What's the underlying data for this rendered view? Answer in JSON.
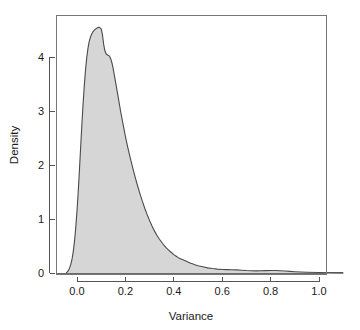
{
  "figure": {
    "background_color": "#ffffff",
    "panel_border_color": "#777777",
    "fill_color": "#d6d6d6",
    "line_color": "#4a4a4a",
    "text_color": "#1a1a1a"
  },
  "chart_data": {
    "type": "area",
    "title": "",
    "subtitle": "",
    "xlabel": "Variance",
    "ylabel": "Density",
    "xlim": [
      -0.06,
      1.12
    ],
    "ylim": [
      -0.08,
      4.75
    ],
    "xticks": [
      0.0,
      0.2,
      0.4,
      0.6,
      0.8,
      1.0
    ],
    "xticklabels": [
      "0.0",
      "0.2",
      "0.4",
      "0.6",
      "0.8",
      "1.0"
    ],
    "yticks": [
      0,
      1,
      2,
      3,
      4
    ],
    "yticklabels": [
      "0",
      "1",
      "2",
      "3",
      "4"
    ],
    "grid": false,
    "legend": null,
    "annotations": [],
    "series": [
      {
        "name": "Variance density",
        "fill": "#d6d6d6",
        "stroke": "#4a4a4a",
        "x": [
          -0.045,
          -0.04,
          -0.035,
          -0.03,
          -0.025,
          -0.02,
          -0.015,
          -0.01,
          -0.005,
          0.0,
          0.005,
          0.01,
          0.015,
          0.02,
          0.025,
          0.03,
          0.035,
          0.04,
          0.045,
          0.05,
          0.055,
          0.06,
          0.065,
          0.07,
          0.075,
          0.08,
          0.085,
          0.09,
          0.095,
          0.1,
          0.105,
          0.11,
          0.115,
          0.12,
          0.125,
          0.13,
          0.135,
          0.14,
          0.145,
          0.15,
          0.16,
          0.17,
          0.18,
          0.19,
          0.2,
          0.21,
          0.22,
          0.23,
          0.24,
          0.25,
          0.26,
          0.27,
          0.28,
          0.29,
          0.3,
          0.31,
          0.32,
          0.33,
          0.34,
          0.35,
          0.36,
          0.37,
          0.38,
          0.39,
          0.4,
          0.41,
          0.42,
          0.43,
          0.44,
          0.45,
          0.46,
          0.47,
          0.48,
          0.49,
          0.5,
          0.52,
          0.54,
          0.56,
          0.58,
          0.6,
          0.62,
          0.64,
          0.66,
          0.68,
          0.7,
          0.72,
          0.74,
          0.76,
          0.78,
          0.8,
          0.82,
          0.84,
          0.86,
          0.88,
          0.9,
          0.95,
          1.0,
          1.05,
          1.1
        ],
        "y": [
          0.0,
          0.02,
          0.05,
          0.1,
          0.17,
          0.27,
          0.41,
          0.6,
          0.85,
          1.15,
          1.5,
          1.9,
          2.32,
          2.74,
          3.12,
          3.46,
          3.75,
          3.98,
          4.15,
          4.28,
          4.36,
          4.42,
          4.46,
          4.49,
          4.51,
          4.53,
          4.54,
          4.55,
          4.54,
          4.52,
          4.42,
          4.24,
          4.12,
          4.06,
          4.04,
          4.03,
          4.01,
          3.96,
          3.88,
          3.77,
          3.52,
          3.26,
          3.0,
          2.76,
          2.53,
          2.32,
          2.13,
          1.95,
          1.78,
          1.62,
          1.47,
          1.33,
          1.2,
          1.08,
          0.97,
          0.87,
          0.78,
          0.7,
          0.63,
          0.57,
          0.51,
          0.46,
          0.42,
          0.38,
          0.34,
          0.31,
          0.28,
          0.26,
          0.24,
          0.22,
          0.2,
          0.18,
          0.165,
          0.15,
          0.135,
          0.115,
          0.095,
          0.082,
          0.072,
          0.065,
          0.062,
          0.06,
          0.057,
          0.052,
          0.046,
          0.042,
          0.04,
          0.041,
          0.044,
          0.047,
          0.046,
          0.042,
          0.036,
          0.03,
          0.024,
          0.014,
          0.008,
          0.004,
          0.002
        ]
      }
    ]
  }
}
